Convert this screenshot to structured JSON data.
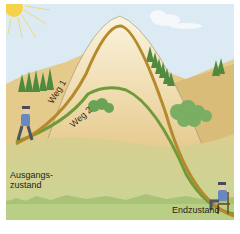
{
  "diagram": {
    "labels": {
      "path1": "Weg 1",
      "path2": "Weg 2",
      "start_line1": "Ausgangs-",
      "start_line2": "zustand",
      "end": "Endzustand"
    },
    "colors": {
      "sky": "#dbeaf2",
      "hill_far": "#e3c98b",
      "hill_near": "#d8b873",
      "meadow": "#cfd79a",
      "grass_bottom": "#b9cf86",
      "path1": "#b48a2c",
      "path2": "#6e9a3a",
      "mountain_fill": "#f3e3b8",
      "trees": "#5d9448",
      "sun": "#f6d24a",
      "person_shirt": "#6a88c0"
    }
  }
}
